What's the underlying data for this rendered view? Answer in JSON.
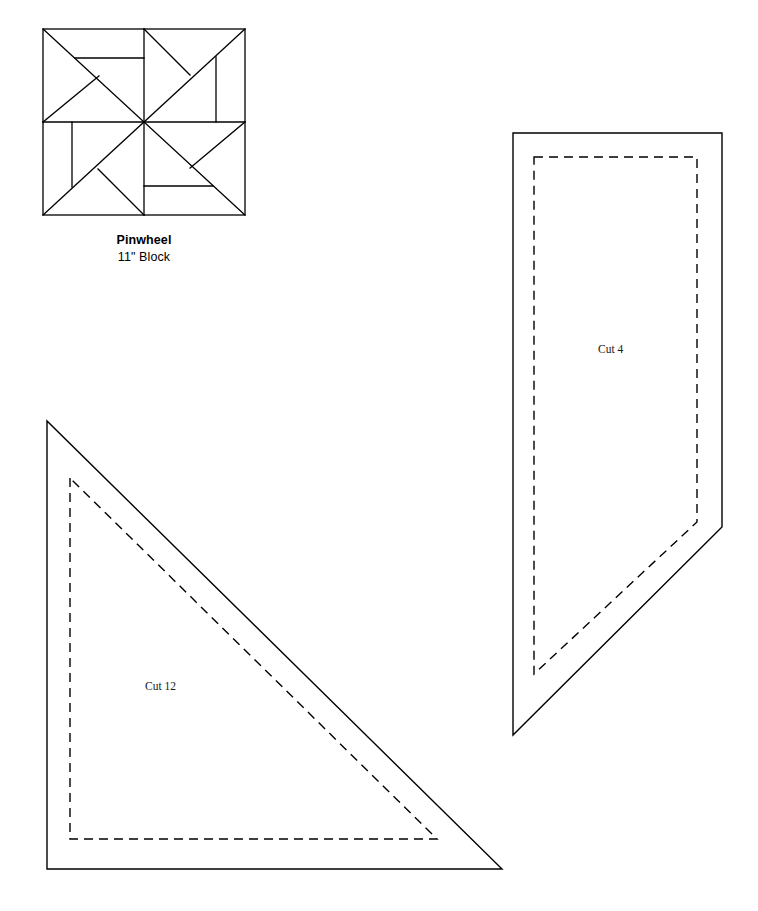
{
  "page": {
    "width": 758,
    "height": 911,
    "background": "#ffffff",
    "ink": "#000000"
  },
  "block": {
    "name": "Pinwheel",
    "size_label": "11\" Block",
    "bounds": {
      "x": 43,
      "y": 29,
      "width": 202,
      "height": 186
    },
    "symmetry": "4-fold rotational pinwheel",
    "stroke": "#000000",
    "stroke_width": 1.2
  },
  "pieces": [
    {
      "id": "cut-12",
      "label": "Cut 12",
      "shape": "right-triangle",
      "cut_outline": [
        [
          47,
          421
        ],
        [
          47,
          869
        ],
        [
          502,
          869
        ]
      ],
      "seam_outline": [
        [
          70,
          478
        ],
        [
          70,
          839
        ],
        [
          437,
          839
        ]
      ],
      "label_position": [
        168,
        687
      ]
    },
    {
      "id": "cut-4",
      "label": "Cut 4",
      "shape": "pentagon",
      "cut_outline": [
        [
          513,
          133
        ],
        [
          722,
          133
        ],
        [
          722,
          527
        ],
        [
          513,
          735
        ]
      ],
      "seam_outline": [
        [
          534,
          157
        ],
        [
          697,
          157
        ],
        [
          697,
          522
        ],
        [
          534,
          674
        ]
      ],
      "label_position": [
        621,
        350
      ]
    }
  ],
  "legend": {
    "solid_line_meaning": "cutting line",
    "dashed_line_meaning": "seam line"
  }
}
